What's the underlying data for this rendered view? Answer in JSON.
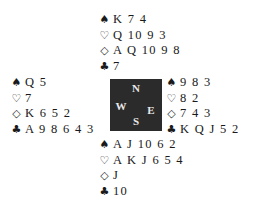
{
  "suits": {
    "spades": "♠",
    "hearts": "♡",
    "diamonds": "◇",
    "clubs": "♣"
  },
  "compass": {
    "north": "N",
    "south": "S",
    "west": "W",
    "east": "E"
  },
  "hands": {
    "north": {
      "spades": "K 7 4",
      "hearts": "Q 10 9 3",
      "diamonds": "A Q 10 9 8",
      "clubs": "7"
    },
    "west": {
      "spades": "Q 5",
      "hearts": "7",
      "diamonds": "K 6 5 2",
      "clubs": "A 9 8 6 4 3"
    },
    "east": {
      "spades": "9 8 3",
      "hearts": "8 2",
      "diamonds": "7 4 3",
      "clubs": "K Q J 5 2"
    },
    "south": {
      "spades": "A J 10 6 2",
      "hearts": "A K J 6 5 4",
      "diamonds": "J",
      "clubs": "10"
    }
  },
  "colors": {
    "compass_background": "#2b2b2b",
    "compass_text": "#e8e8e8",
    "ink": "#1a1a1a"
  }
}
